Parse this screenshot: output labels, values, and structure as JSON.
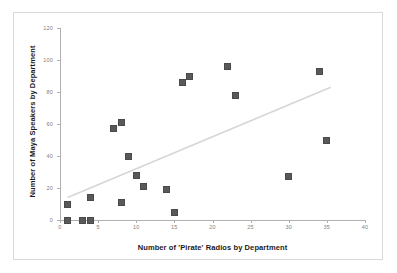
{
  "chart_data": {
    "type": "scatter",
    "title": "",
    "xlabel": "Number of 'Pirate' Radios by Department",
    "ylabel": "Number of Maya Speakers by Department",
    "xlim": [
      0,
      40
    ],
    "ylim": [
      0,
      120
    ],
    "xticks": [
      0,
      5,
      10,
      15,
      20,
      25,
      30,
      35,
      40
    ],
    "yticks": [
      0,
      20,
      40,
      60,
      80,
      100,
      120
    ],
    "xtick_labels": [
      "0",
      "5",
      "10",
      "15",
      "20",
      "25",
      "30",
      "35",
      "40"
    ],
    "ytick_labels": [
      "0",
      "20",
      "40",
      "60",
      "80",
      "100",
      "120"
    ],
    "grid": false,
    "legend": false,
    "marker_color": "#595959",
    "marker_shape": "square",
    "trendline": {
      "present": true,
      "color": "#d6d6d6",
      "x_start": 1.0,
      "y_start": 14.0,
      "x_end": 35.5,
      "y_end": 83.0
    },
    "points": [
      {
        "x": 1,
        "y": 10
      },
      {
        "x": 1,
        "y": 0
      },
      {
        "x": 3,
        "y": 0
      },
      {
        "x": 4,
        "y": 0
      },
      {
        "x": 4,
        "y": 14
      },
      {
        "x": 7,
        "y": 57
      },
      {
        "x": 8,
        "y": 61
      },
      {
        "x": 8,
        "y": 11
      },
      {
        "x": 9,
        "y": 40
      },
      {
        "x": 10,
        "y": 28
      },
      {
        "x": 11,
        "y": 21
      },
      {
        "x": 14,
        "y": 19
      },
      {
        "x": 15,
        "y": 5
      },
      {
        "x": 16,
        "y": 86
      },
      {
        "x": 17,
        "y": 90
      },
      {
        "x": 22,
        "y": 96
      },
      {
        "x": 23,
        "y": 78
      },
      {
        "x": 30,
        "y": 27
      },
      {
        "x": 34,
        "y": 93
      },
      {
        "x": 35,
        "y": 50
      }
    ]
  }
}
